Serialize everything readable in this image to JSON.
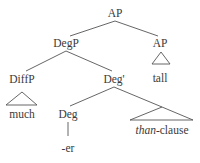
{
  "diagram": {
    "type": "syntax-tree",
    "nodes": {
      "root": {
        "label": "AP"
      },
      "degp": {
        "label": "DegP"
      },
      "ap_right": {
        "label": "AP"
      },
      "tall": {
        "label": "tall"
      },
      "diffp": {
        "label": "DiffP"
      },
      "much": {
        "label": "much"
      },
      "degbar": {
        "label": "Deg'"
      },
      "deg": {
        "label": "Deg"
      },
      "er": {
        "label": "-er"
      },
      "than_clause": {
        "label_italic": "than",
        "label_rest": "-clause"
      }
    },
    "edges": [
      {
        "from": "AP",
        "to": "DegP"
      },
      {
        "from": "AP",
        "to": "AP"
      },
      {
        "from": "DegP",
        "to": "DiffP"
      },
      {
        "from": "DegP",
        "to": "Deg'"
      },
      {
        "from": "AP",
        "to": "tall",
        "style": "triangle"
      },
      {
        "from": "DiffP",
        "to": "much",
        "style": "triangle"
      },
      {
        "from": "Deg'",
        "to": "Deg"
      },
      {
        "from": "Deg'",
        "to": "than-clause",
        "style": "triangle"
      },
      {
        "from": "Deg",
        "to": "-er"
      }
    ]
  }
}
